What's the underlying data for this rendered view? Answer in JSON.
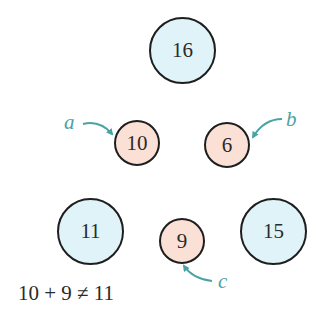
{
  "colors": {
    "blue_fill": "#dff3f9",
    "pink_fill": "#fbe0d6",
    "outline": "#1e1e1e",
    "annotation": "#4aa3a3",
    "text": "#2a2a2a"
  },
  "nodes": [
    {
      "id": "top",
      "value": "16",
      "color": "blue",
      "size": "big"
    },
    {
      "id": "left-mid",
      "value": "10",
      "color": "pink",
      "size": "small"
    },
    {
      "id": "right-mid",
      "value": "6",
      "color": "pink",
      "size": "small"
    },
    {
      "id": "bottom-left",
      "value": "11",
      "color": "blue",
      "size": "big"
    },
    {
      "id": "bottom-center",
      "value": "9",
      "color": "pink",
      "size": "small"
    },
    {
      "id": "bottom-right",
      "value": "15",
      "color": "blue",
      "size": "big"
    }
  ],
  "labels": {
    "a": "a",
    "b": "b",
    "c": "c"
  },
  "equation": "10 + 9 ≠ 11"
}
